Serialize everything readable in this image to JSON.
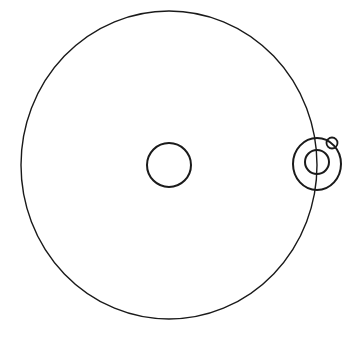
{
  "diagram": {
    "title": "",
    "colors": {
      "background": "#ffffff",
      "stroke": "#1a1a1a"
    },
    "elements": {
      "main_orbit": {
        "cx": 169,
        "cy": 165,
        "rx": 148,
        "ry": 154,
        "stroke_width": 1.4
      },
      "central_body": {
        "cx": 169,
        "cy": 165,
        "r": 22,
        "stroke_width": 2
      },
      "satellite_orbit_ring": {
        "cx": 317,
        "cy": 164,
        "rx": 24,
        "ry": 26,
        "stroke_width": 2
      },
      "satellite_body": {
        "cx": 317,
        "cy": 162,
        "r": 12,
        "stroke_width": 2
      },
      "moon": {
        "cx": 332,
        "cy": 143,
        "r": 5.5,
        "stroke_width": 1.8
      }
    }
  }
}
